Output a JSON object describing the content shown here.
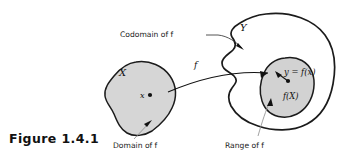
{
  "figure": {
    "caption": "Figure  1.4.1",
    "type": "diagram",
    "background_color": "#ffffff",
    "ink_color": "#1b1b1b",
    "fill_color": "#d6d6d6"
  },
  "sets": {
    "domain_set": {
      "label": "X",
      "annotation": "Domain of f",
      "fill": "#d6d6d6",
      "position": "left"
    },
    "codomain_set": {
      "label": "Y",
      "annotation": "Codomain of f",
      "fill": "#ffffff",
      "position": "right"
    },
    "range_set": {
      "label": "f(X)",
      "annotation": "Range of f",
      "fill": "#d2d2d2",
      "position": "inside-codomain"
    }
  },
  "points": {
    "domain_point": "x",
    "image_point": "y = f(x)"
  },
  "map": {
    "label": "f",
    "from": "x",
    "to": "y = f(x)"
  },
  "annotations": [
    {
      "text": "Codomain of f",
      "target": "codomain_set"
    },
    {
      "text": "Domain of f",
      "target": "domain_set"
    },
    {
      "text": "Range of f",
      "target": "range_set"
    }
  ]
}
